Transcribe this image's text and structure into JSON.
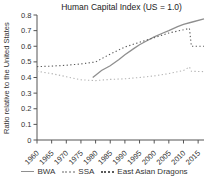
{
  "figure": {
    "background": "#ffffff",
    "axis_color": "#555555",
    "text_color": "#333333"
  },
  "chart_data": {
    "type": "line",
    "title": "Human Capital Index (US = 1.0)",
    "xlabel": "",
    "ylabel": "Ratio relative to the United States",
    "xlim": [
      1960,
      2017
    ],
    "ylim": [
      0,
      0.8
    ],
    "x_ticks": [
      1960,
      1965,
      1970,
      1975,
      1980,
      1985,
      1990,
      1995,
      2000,
      2005,
      2010,
      2015
    ],
    "y_ticks": [
      0,
      0.1,
      0.2,
      0.3,
      0.4,
      0.5,
      0.6,
      0.7,
      0.8
    ],
    "grid": false,
    "legend_position": "bottom",
    "series": [
      {
        "name": "BWA",
        "style": "solid",
        "color": "#8f8f8f",
        "points": [
          [
            1979,
            0.4
          ],
          [
            1980,
            0.415
          ],
          [
            1982,
            0.445
          ],
          [
            1985,
            0.475
          ],
          [
            1988,
            0.515
          ],
          [
            1990,
            0.545
          ],
          [
            1993,
            0.585
          ],
          [
            1995,
            0.61
          ],
          [
            1998,
            0.64
          ],
          [
            2000,
            0.66
          ],
          [
            2003,
            0.685
          ],
          [
            2005,
            0.7
          ],
          [
            2008,
            0.725
          ],
          [
            2010,
            0.74
          ],
          [
            2013,
            0.755
          ],
          [
            2017,
            0.775
          ]
        ]
      },
      {
        "name": "SSA",
        "style": "dotted",
        "color": "#b3b3b3",
        "points": [
          [
            1960,
            0.44
          ],
          [
            1965,
            0.425
          ],
          [
            1970,
            0.405
          ],
          [
            1975,
            0.385
          ],
          [
            1980,
            0.38
          ],
          [
            1985,
            0.388
          ],
          [
            1990,
            0.392
          ],
          [
            1995,
            0.4
          ],
          [
            2000,
            0.41
          ],
          [
            2005,
            0.425
          ],
          [
            2010,
            0.445
          ],
          [
            2012,
            0.468
          ],
          [
            2012.7,
            0.44
          ],
          [
            2017,
            0.438
          ]
        ]
      },
      {
        "name": "East Asian Dragons",
        "style": "dotted",
        "color": "#5a5a5a",
        "points": [
          [
            1960,
            0.47
          ],
          [
            1965,
            0.473
          ],
          [
            1970,
            0.478
          ],
          [
            1975,
            0.487
          ],
          [
            1980,
            0.5
          ],
          [
            1985,
            0.55
          ],
          [
            1990,
            0.595
          ],
          [
            1995,
            0.625
          ],
          [
            2000,
            0.655
          ],
          [
            2005,
            0.685
          ],
          [
            2010,
            0.705
          ],
          [
            2012,
            0.715
          ],
          [
            2012.7,
            0.6
          ],
          [
            2017,
            0.6
          ]
        ]
      }
    ]
  }
}
